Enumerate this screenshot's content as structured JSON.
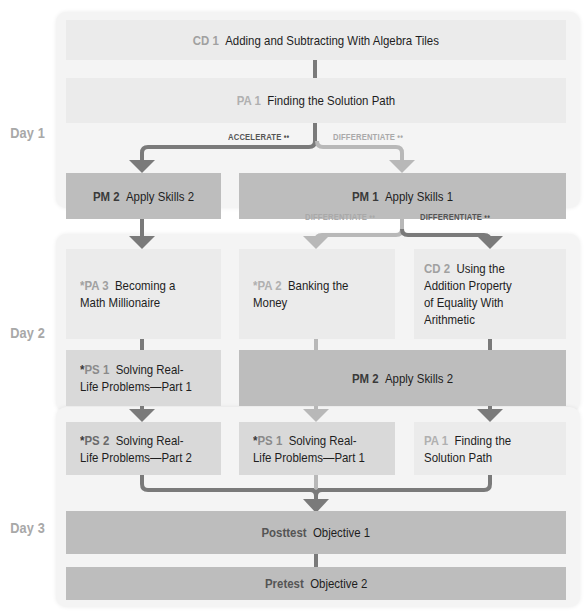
{
  "days": [
    {
      "label": "Day 1"
    },
    {
      "label": "Day 2"
    },
    {
      "label": "Day 3"
    }
  ],
  "day1": {
    "cd1": {
      "code": "CD 1",
      "title": "Adding and Subtracting With Algebra Tiles"
    },
    "pa1": {
      "code": "PA 1",
      "title": "Finding the Solution Path"
    },
    "branch_labels": {
      "accelerate": "ACCELERATE",
      "differentiate": "DIFFERENTIATE"
    },
    "pm2": {
      "code": "PM 2",
      "title": "Apply Skills 2"
    },
    "pm1": {
      "code": "PM 1",
      "title": "Apply Skills 1"
    }
  },
  "day1_to_day2": {
    "branch_labels": {
      "differentiate_left": "DIFFERENTIATE",
      "differentiate_right": "DIFFERENTIATE"
    }
  },
  "day2": {
    "pa3": {
      "star": "*",
      "code": "PA 3",
      "title": "Becoming a\nMath Millionaire"
    },
    "pa2": {
      "star": "*",
      "code": "PA 2",
      "title": "Banking the\nMoney"
    },
    "cd2": {
      "code": "CD 2",
      "title": "Using the\nAddition Property\nof Equality With\nArithmetic"
    },
    "ps1": {
      "star": "*",
      "code": "PS 1",
      "title": "Solving Real-\nLife Problems—Part 1"
    },
    "pm2": {
      "code": "PM 2",
      "title": "Apply Skills 2"
    }
  },
  "day3": {
    "ps2": {
      "star": "*",
      "code": "PS 2",
      "title": "Solving Real-\nLife Problems—Part 2"
    },
    "ps1": {
      "star": "*",
      "code": "PS 1",
      "title": "Solving Real-\nLife Problems—Part 1"
    },
    "pa1": {
      "code": "PA 1",
      "title": "Finding the\nSolution Path"
    },
    "posttest": {
      "code": "Posttest",
      "title": "Objective 1"
    },
    "pretest": {
      "code": "Pretest",
      "title": "Objective 2"
    }
  },
  "icons": {
    "group": "••"
  },
  "colors": {
    "arrow_dark": "#7a7a7a",
    "arrow_light": "#b8b8b8",
    "box_light": "#ebebeb",
    "box_mid": "#d9d9d9",
    "box_dark": "#bdbdbd",
    "panel": "#f4f4f4",
    "code_grey": "#a0a0a0"
  }
}
